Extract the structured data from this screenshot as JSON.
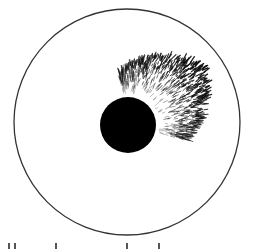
{
  "figure": {
    "type": "illustration",
    "outer_circle": {
      "cx": 127,
      "cy": 122,
      "r": 113,
      "stroke": "#333333"
    },
    "inner_disc": {
      "cx": 128,
      "cy": 125,
      "r": 28,
      "fill": "#000000"
    },
    "fan": {
      "center": [
        128,
        125
      ],
      "start_angle_deg": -100,
      "end_angle_deg": 15,
      "inner_r": 30,
      "outer_r": 95,
      "color": "#111111"
    }
  },
  "caption": {
    "visible": "partially cropped, illegible"
  }
}
